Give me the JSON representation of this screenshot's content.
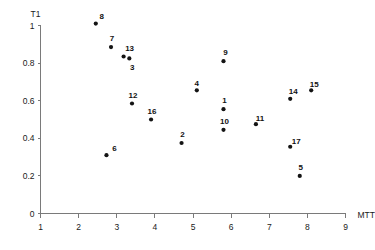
{
  "chart_data": {
    "type": "scatter",
    "title": "",
    "xlabel": "MTT",
    "ylabel": "T1",
    "xlim": [
      1,
      9
    ],
    "ylim": [
      0,
      1
    ],
    "grid": false,
    "legend": "none",
    "x_ticks": [
      "1",
      "2",
      "3",
      "4",
      "5",
      "6",
      "7",
      "8",
      "9"
    ],
    "x_tick_values": [
      1,
      2,
      3,
      4,
      5,
      6,
      7,
      8,
      9
    ],
    "y_ticks": [
      "0",
      "0.2",
      "0.4",
      "0.6",
      "0.8",
      "1"
    ],
    "y_tick_values": [
      0,
      0.2,
      0.4,
      0.6,
      0.8,
      1
    ],
    "point_label_field": "label",
    "points": [
      {
        "label": "8",
        "x": 2.45,
        "y": 1.01,
        "label_dx": 6,
        "label_dy": -5
      },
      {
        "label": "7",
        "x": 2.85,
        "y": 0.885,
        "label_dx": 1,
        "label_dy": -6
      },
      {
        "label": "13",
        "x": 3.18,
        "y": 0.835,
        "label_dx": 6,
        "label_dy": -6
      },
      {
        "label": "3",
        "x": 3.33,
        "y": 0.825,
        "label_dx": 3,
        "label_dy": 12
      },
      {
        "label": "12",
        "x": 3.4,
        "y": 0.585,
        "label_dx": 1,
        "label_dy": -6
      },
      {
        "label": "16",
        "x": 3.9,
        "y": 0.5,
        "label_dx": 1,
        "label_dy": -6
      },
      {
        "label": "6",
        "x": 2.73,
        "y": 0.31,
        "label_dx": 8,
        "label_dy": -4
      },
      {
        "label": "2",
        "x": 4.7,
        "y": 0.375,
        "label_dx": 1,
        "label_dy": -6
      },
      {
        "label": "4",
        "x": 5.1,
        "y": 0.655,
        "label_dx": 0,
        "label_dy": -4
      },
      {
        "label": "9",
        "x": 5.8,
        "y": 0.81,
        "label_dx": 2,
        "label_dy": -6
      },
      {
        "label": "1",
        "x": 5.8,
        "y": 0.555,
        "label_dx": 1,
        "label_dy": -6
      },
      {
        "label": "10",
        "x": 5.8,
        "y": 0.445,
        "label_dx": 1,
        "label_dy": -6
      },
      {
        "label": "11",
        "x": 6.65,
        "y": 0.475,
        "label_dx": 4,
        "label_dy": -3
      },
      {
        "label": "14",
        "x": 7.55,
        "y": 0.61,
        "label_dx": 3,
        "label_dy": -5
      },
      {
        "label": "15",
        "x": 8.1,
        "y": 0.655,
        "label_dx": 3,
        "label_dy": -3
      },
      {
        "label": "17",
        "x": 7.55,
        "y": 0.355,
        "label_dx": 6,
        "label_dy": -3
      },
      {
        "label": "5",
        "x": 7.8,
        "y": 0.2,
        "label_dx": 1,
        "label_dy": -6
      }
    ]
  },
  "axes": {
    "x_axis_title": "MTT",
    "y_axis_title": "T1"
  },
  "colors": {
    "marker": "#141414",
    "axis": "#7a7a7a",
    "text": "#1a1a1a",
    "background": "#ffffff"
  }
}
